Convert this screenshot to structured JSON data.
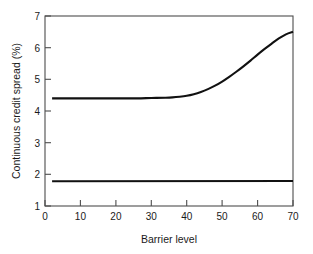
{
  "chart_data": {
    "type": "line",
    "title": "",
    "xlabel": "Barrier level",
    "ylabel": "Continuous credit spread (%)",
    "xlim": [
      0,
      70
    ],
    "ylim": [
      1,
      7
    ],
    "xticks": [
      0,
      10,
      20,
      30,
      40,
      50,
      60,
      70
    ],
    "yticks": [
      1,
      2,
      3,
      4,
      5,
      6,
      7
    ],
    "xtick_labels": [
      "0",
      "10",
      "20",
      "30",
      "40",
      "50",
      "60",
      "70"
    ],
    "ytick_labels": [
      "1",
      "2",
      "3",
      "4",
      "5",
      "6",
      "7"
    ],
    "grid": false,
    "legend": false,
    "line_color": "#111111",
    "frame_color": "#4d4d4d",
    "background": "#ffffff",
    "series": [
      {
        "name": "upper-curve",
        "x": [
          2,
          6,
          10,
          14,
          18,
          22,
          26,
          30,
          34,
          36,
          38,
          40,
          42,
          44,
          46,
          48,
          50,
          52,
          54,
          56,
          58,
          60,
          62,
          64,
          66,
          68,
          70
        ],
        "values": [
          4.4,
          4.4,
          4.4,
          4.4,
          4.4,
          4.4,
          4.4,
          4.41,
          4.42,
          4.43,
          4.45,
          4.48,
          4.53,
          4.6,
          4.69,
          4.8,
          4.93,
          5.08,
          5.24,
          5.41,
          5.59,
          5.78,
          5.96,
          6.13,
          6.29,
          6.42,
          6.5
        ]
      },
      {
        "name": "lower-line",
        "x": [
          2,
          70
        ],
        "values": [
          1.78,
          1.79
        ]
      }
    ]
  },
  "figure": {
    "xlabel": "Barrier level",
    "ylabel": "Continuous credit spread (%)"
  }
}
